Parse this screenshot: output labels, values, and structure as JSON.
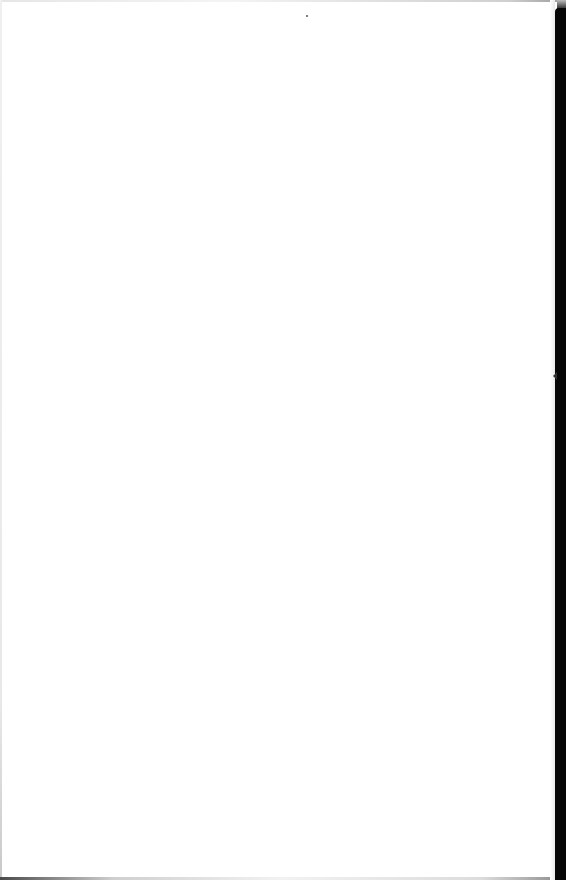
{
  "document": {
    "type": "scanned-page",
    "content": "",
    "is_blank": true
  },
  "colors": {
    "paper": "#ffffff",
    "binding": "#050505"
  }
}
